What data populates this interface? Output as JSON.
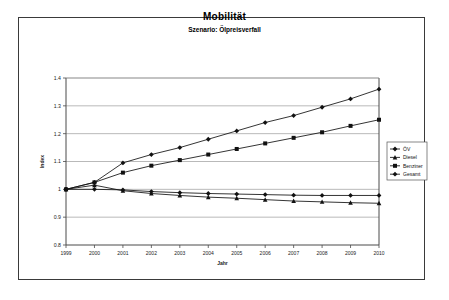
{
  "chart_data": {
    "type": "line",
    "title": "Mobilität",
    "subtitle": "Szenario: Ölpreisverfall",
    "xlabel": "Jahr",
    "ylabel": "Index",
    "categories": [
      1999,
      2000,
      2001,
      2002,
      2003,
      2004,
      2005,
      2006,
      2007,
      2008,
      2009,
      2010
    ],
    "xlim": [
      1999,
      2010
    ],
    "ylim": [
      0.8,
      1.4
    ],
    "yticks": [
      0.8,
      0.9,
      1,
      1.1,
      1.2,
      1.3,
      1.4
    ],
    "ytick_labels": [
      "0.8",
      "0.9",
      "1",
      "1.1",
      "1.2",
      "1.3",
      "1.4"
    ],
    "xtick_labels": [
      "1999",
      "2000",
      "2001",
      "2002",
      "2003",
      "2004",
      "2005",
      "2006",
      "2007",
      "2008",
      "2009",
      "2010"
    ],
    "grid": "horizontal",
    "legend_position": "right-middle",
    "series": [
      {
        "name": "ÖV",
        "marker": "diamond",
        "color": "#111111",
        "values": [
          1.0,
          1.025,
          1.095,
          1.125,
          1.15,
          1.18,
          1.21,
          1.24,
          1.265,
          1.295,
          1.325,
          1.36
        ]
      },
      {
        "name": "Diesel",
        "marker": "triangle",
        "color": "#111111",
        "values": [
          1.0,
          1.015,
          0.995,
          0.985,
          0.978,
          0.972,
          0.968,
          0.963,
          0.958,
          0.955,
          0.952,
          0.95
        ]
      },
      {
        "name": "Benziner",
        "marker": "square",
        "color": "#111111",
        "values": [
          1.0,
          1.025,
          1.06,
          1.085,
          1.105,
          1.125,
          1.145,
          1.165,
          1.185,
          1.205,
          1.228,
          1.25
        ]
      },
      {
        "name": "Gesamt",
        "marker": "diamond",
        "color": "#111111",
        "values": [
          1.0,
          1.0,
          0.998,
          0.992,
          0.988,
          0.985,
          0.983,
          0.981,
          0.979,
          0.978,
          0.978,
          0.978
        ]
      }
    ]
  }
}
